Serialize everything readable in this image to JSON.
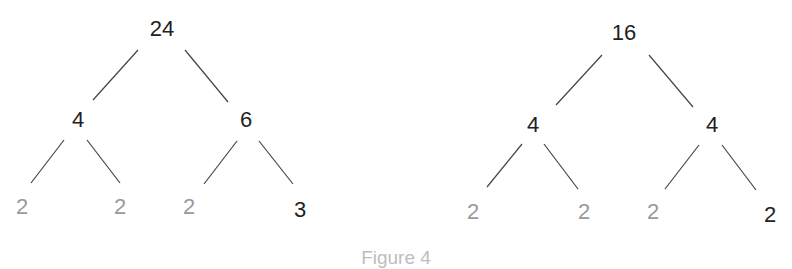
{
  "figure": {
    "caption": "Figure 4",
    "colors": {
      "dark_text": "#222222",
      "light_text": "#9a9a9a",
      "caption": "#bdbdbd",
      "edge": "#444444"
    },
    "trees": [
      {
        "root": "24",
        "children": [
          {
            "value": "4",
            "children": [
              {
                "value": "2",
                "style": "light"
              },
              {
                "value": "2",
                "style": "light"
              }
            ]
          },
          {
            "value": "6",
            "children": [
              {
                "value": "2",
                "style": "light"
              },
              {
                "value": "3",
                "style": "dark"
              }
            ]
          }
        ]
      },
      {
        "root": "16",
        "children": [
          {
            "value": "4",
            "children": [
              {
                "value": "2",
                "style": "light"
              },
              {
                "value": "2",
                "style": "light"
              }
            ]
          },
          {
            "value": "4",
            "children": [
              {
                "value": "2",
                "style": "light"
              },
              {
                "value": "2",
                "style": "dark"
              }
            ]
          }
        ]
      }
    ]
  }
}
